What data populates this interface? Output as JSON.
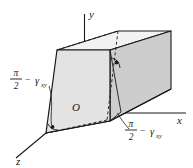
{
  "figure": {
    "background_color": "#ffffff",
    "line_color": "#1a1a1a",
    "face_front_color": "#e2e2e2",
    "face_top_color": "#f2f2f2",
    "face_right_color": "#cfcfcf",
    "width": 193,
    "height": 168
  },
  "axes": {
    "x_label": "x",
    "y_label": "y",
    "z_label": "z",
    "origin_label": "O"
  },
  "annotations": {
    "left": {
      "numerator": "π",
      "denominator": "2",
      "operator": "−",
      "symbol": "γ",
      "subscript": "xy"
    },
    "right": {
      "numerator": "π",
      "denominator": "2",
      "operator": "−",
      "symbol": "γ",
      "subscript": "xy"
    }
  }
}
